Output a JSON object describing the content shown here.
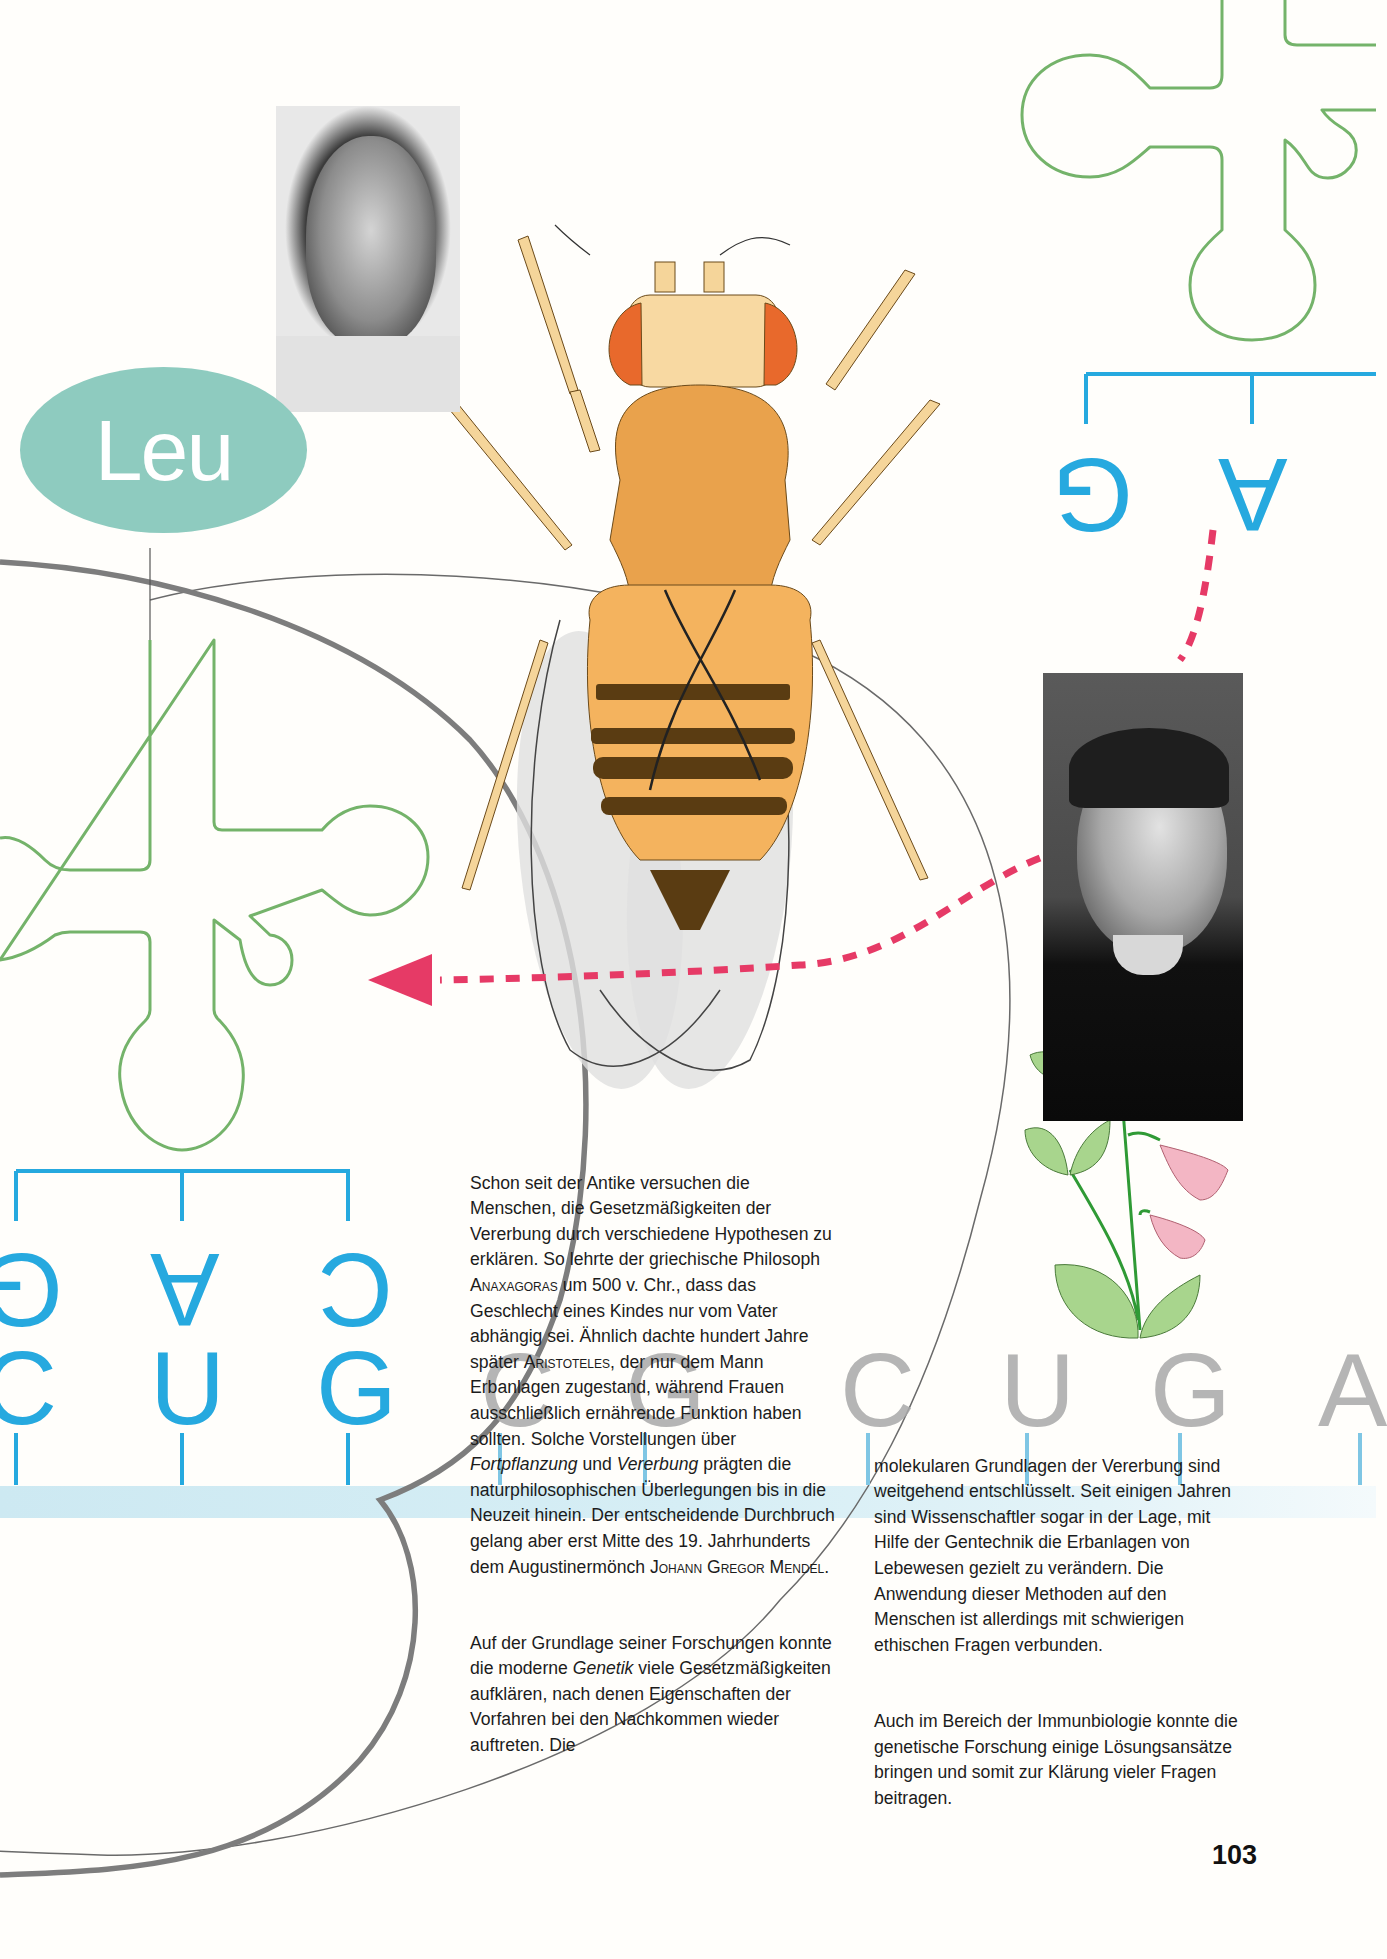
{
  "badge": {
    "label": "Leu",
    "color": "#8ecbbf"
  },
  "colors": {
    "trna_outline": "#74b36a",
    "codon_blue": "#26a9df",
    "arrow_pink": "#e63a66",
    "grey_curve": "#7a7a7a",
    "band_blue": "#d3ecf4"
  },
  "left_codon": {
    "anticodon": [
      "G",
      "A",
      "C"
    ],
    "codon": [
      "C",
      "U",
      "G"
    ]
  },
  "right_codon": {
    "anticodon": [
      "G",
      "A"
    ]
  },
  "grey_sequence": [
    "C",
    "G",
    "C",
    "U",
    "G",
    "A"
  ],
  "photos": {
    "top_left": "portrait-photo-elderly-man-glasses",
    "right": "portrait-photo-gregor-mendel"
  },
  "illustrations": {
    "fly": "drosophila-fruit-fly-illustration",
    "plant": "pea-plant-flowers-illustration"
  },
  "article": {
    "left_column": {
      "para1": [
        {
          "t": "Schon seit der Antike versuchen die Menschen, die Gesetzmäßigkeiten der Vererbung durch verschiedene Hypothesen zu erklären. So lehrte der griechische Philosoph "
        },
        {
          "t": "Anaxagoras",
          "sc": true
        },
        {
          "t": " um 500 v. Chr., dass das Geschlecht eines Kindes nur vom Vater abhängig sei. Ähnlich dachte hundert Jahre später "
        },
        {
          "t": "Aristoteles",
          "sc": true
        },
        {
          "t": ", der nur dem Mann Erbanlagen zugestand, während Frauen ausschließlich ernährende Funktion haben sollten. Solche Vorstellungen über "
        },
        {
          "t": "Fortpflanzung",
          "i": true
        },
        {
          "t": " und "
        },
        {
          "t": "Vererbung",
          "i": true
        },
        {
          "t": " prägten die naturphilosophischen Überlegungen bis in die Neuzeit hinein. Der entscheidende Durchbruch gelang aber erst Mitte des 19. Jahrhunderts dem Augustinermönch "
        },
        {
          "t": "Johann Gregor Mendel",
          "sc": true
        },
        {
          "t": "."
        }
      ],
      "para2": [
        {
          "t": "Auf der Grundlage seiner Forschungen konnte die moderne "
        },
        {
          "t": "Genetik",
          "i": true
        },
        {
          "t": " viele Gesetzmäßigkeiten aufklären, nach denen Eigenschaften der Vorfahren bei den Nachkommen wieder auftreten. Die"
        }
      ]
    },
    "right_column": {
      "para1": "molekularen Grundlagen der Vererbung sind weitgehend entschlüsselt. Seit einigen Jahren sind Wissenschaftler sogar in der Lage, mit Hilfe der Gentechnik die Erbanlagen von Lebewesen gezielt zu verändern. Die Anwendung dieser Methoden auf den Menschen ist allerdings mit schwierigen ethischen Fragen verbunden.",
      "para2": "Auch im Bereich der Immunbiologie konnte die genetische Forschung einige Lösungsansätze bringen und somit zur Klärung vieler Fragen beitragen."
    }
  },
  "page_number": "103"
}
